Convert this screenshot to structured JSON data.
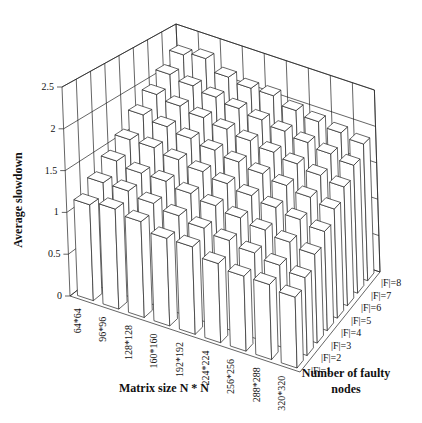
{
  "chart_data": {
    "type": "bar3d",
    "title": "",
    "xlabel": "Matrix size N * N",
    "ylabel": "Number of faulty nodes",
    "zlabel": "Average slowdown",
    "zlim": [
      0,
      2.5
    ],
    "zticks": [
      "0",
      "0.5",
      "1",
      "1.5",
      "2",
      "2.5"
    ],
    "categories": [
      "64*64",
      "96*96",
      "128*128",
      "160*160",
      "192*192",
      "224*224",
      "256*256",
      "288*288",
      "320*320"
    ],
    "series": [
      {
        "name": "|F|=1",
        "values": [
          1.15,
          1.2,
          1.15,
          1.05,
          1.05,
          0.95,
          0.9,
          0.9,
          0.85
        ]
      },
      {
        "name": "|F|=2",
        "values": [
          1.3,
          1.3,
          1.25,
          1.2,
          1.15,
          1.1,
          1.05,
          1.0,
          0.95
        ]
      },
      {
        "name": "|F|=3",
        "values": [
          1.45,
          1.4,
          1.4,
          1.35,
          1.3,
          1.25,
          1.2,
          1.15,
          1.1
        ]
      },
      {
        "name": "|F|=4",
        "values": [
          1.6,
          1.6,
          1.55,
          1.5,
          1.45,
          1.4,
          1.35,
          1.3,
          1.25
        ]
      },
      {
        "name": "|F|=5",
        "values": [
          1.8,
          1.75,
          1.7,
          1.65,
          1.6,
          1.55,
          1.5,
          1.45,
          1.4
        ]
      },
      {
        "name": "|F|=6",
        "values": [
          1.95,
          1.9,
          1.85,
          1.8,
          1.75,
          1.7,
          1.65,
          1.6,
          1.55
        ]
      },
      {
        "name": "|F|=7",
        "values": [
          2.1,
          2.05,
          2.0,
          1.95,
          1.9,
          1.85,
          1.8,
          1.75,
          1.7
        ]
      },
      {
        "name": "|F|=8",
        "values": [
          2.25,
          2.3,
          2.15,
          2.1,
          2.1,
          2.0,
          1.95,
          1.9,
          1.85
        ]
      }
    ],
    "grid": true,
    "legend": "none (series labeled along depth axis)"
  },
  "labels": {
    "zaxis_title": "Average slowdown",
    "xaxis_title": "Matrix size N * N",
    "yaxis_title_line1": "Number of faulty",
    "yaxis_title_line2": "nodes"
  }
}
